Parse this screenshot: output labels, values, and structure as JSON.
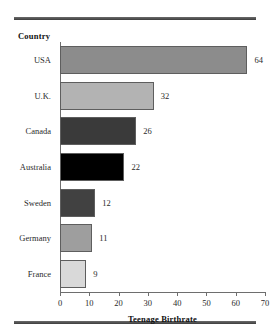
{
  "rules": {
    "top": "horizontal-rule",
    "bottom": "horizontal-rule"
  },
  "header": {
    "category_axis_label": "Country"
  },
  "chart_data": {
    "type": "bar",
    "orientation": "horizontal",
    "title": "",
    "xlabel": "Teenage Birthrate",
    "ylabel": "Country",
    "categories": [
      "USA",
      "U.K.",
      "Canada",
      "Australia",
      "Sweden",
      "Germany",
      "France"
    ],
    "values": [
      64,
      32,
      26,
      22,
      12,
      11,
      9
    ],
    "value_labels": [
      "64",
      "32",
      "26",
      "22",
      "12",
      "11",
      "9"
    ],
    "bar_colors": [
      "#8c8c8c",
      "#b3b3b3",
      "#3a3a3a",
      "#000000",
      "#414141",
      "#9e9e9e",
      "#d9d9d9"
    ],
    "bar_outline": "#5e5e5e",
    "xlim": [
      0,
      70
    ],
    "xticks": [
      0,
      10,
      20,
      30,
      40,
      50,
      60,
      70
    ],
    "xtick_labels": [
      "0",
      "10",
      "20",
      "30",
      "40",
      "50",
      "60",
      "70"
    ],
    "grid": false,
    "legend": false
  }
}
